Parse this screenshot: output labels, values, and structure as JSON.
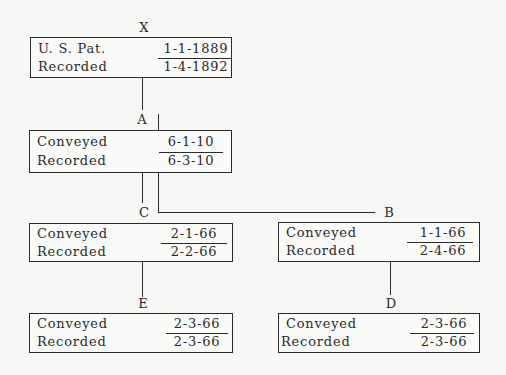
{
  "diagram": {
    "type": "chain-of-title",
    "nodes": {
      "X": {
        "label": "X",
        "row1_label": "U. S. Pat.",
        "row1_value": "1-1-1889",
        "row2_label": "Recorded",
        "row2_value": "1-4-1892"
      },
      "A": {
        "label": "A",
        "row1_label": "Conveyed",
        "row1_value": "6-1-10",
        "row2_label": "Recorded",
        "row2_value": "6-3-10"
      },
      "C": {
        "label": "C",
        "row1_label": "Conveyed",
        "row1_value": "2-1-66",
        "row2_label": "Recorded",
        "row2_value": "2-2-66"
      },
      "B": {
        "label": "B",
        "row1_label": "Conveyed",
        "row1_value": "1-1-66",
        "row2_label": "Recorded",
        "row2_value": "2-4-66"
      },
      "E": {
        "label": "E",
        "row1_label": "Conveyed",
        "row1_value": "2-3-66",
        "row2_label": "Recorded",
        "row2_value": "2-3-66"
      },
      "D": {
        "label": "D",
        "row1_label": "Conveyed",
        "row1_value": "2-3-66",
        "row2_label": "Recorded",
        "row2_value": "2-3-66"
      }
    },
    "edges": [
      [
        "X",
        "A"
      ],
      [
        "A",
        "C"
      ],
      [
        "A",
        "B"
      ],
      [
        "C",
        "E"
      ],
      [
        "B",
        "D"
      ]
    ]
  }
}
